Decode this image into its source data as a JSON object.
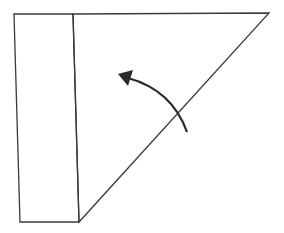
{
  "diagram": {
    "type": "origami-fold-step",
    "stroke_color": "#3a3a3a",
    "background": "#ffffff",
    "shapes": {
      "folded_flap": {
        "points": "14,14 73,14 79,222 20,222"
      },
      "triangle": {
        "points": "73,14 269,13 79,222"
      }
    },
    "arrow": {
      "icon": "curved-fold-arrow",
      "direction": "up-left",
      "path": "M187,132 Q172,90 128,78",
      "head_points": "118,74 133,70 128,86"
    }
  }
}
